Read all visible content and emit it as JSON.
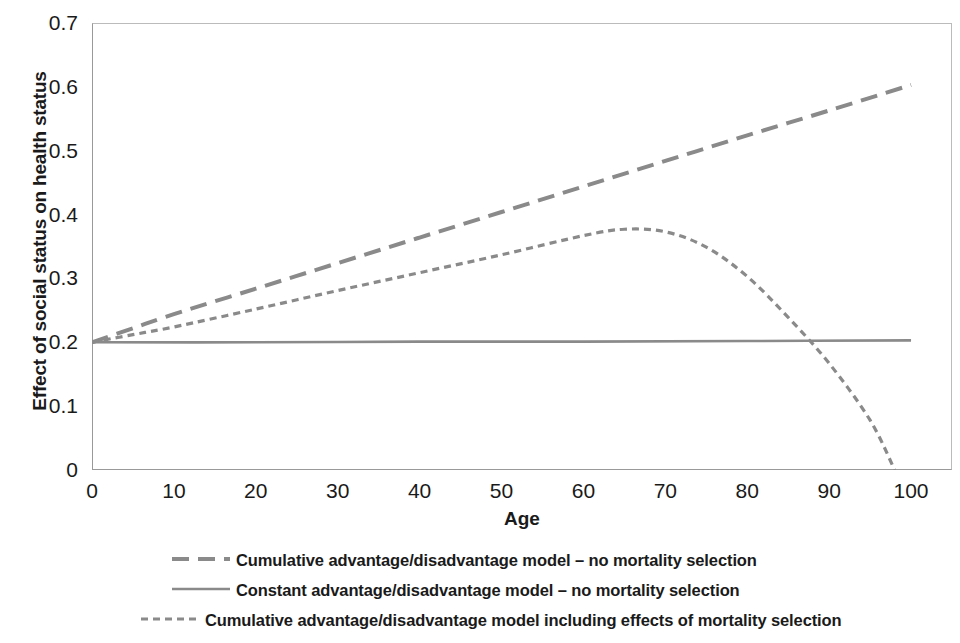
{
  "chart_data": {
    "type": "line",
    "title": "",
    "xlabel": "Age",
    "ylabel": "Effect of social status on health status",
    "xlim": [
      0,
      105
    ],
    "ylim": [
      0,
      0.7
    ],
    "xticks": [
      "0",
      "10",
      "20",
      "30",
      "40",
      "50",
      "60",
      "70",
      "80",
      "90",
      "100"
    ],
    "xtick_values": [
      0,
      10,
      20,
      30,
      40,
      50,
      60,
      70,
      80,
      90,
      100
    ],
    "yticks": [
      "0",
      "0.1",
      "0.2",
      "0.3",
      "0.4",
      "0.5",
      "0.6",
      "0.7"
    ],
    "ytick_values": [
      0,
      0.1,
      0.2,
      0.3,
      0.4,
      0.5,
      0.6,
      0.7
    ],
    "grid": false,
    "legend_position": "below",
    "line_color": "#8a8a8a",
    "axis_color": "#999999",
    "series": [
      {
        "name": "Cumulative advantage/disadvantage model – no mortality selection",
        "style": "long-dash",
        "x": [
          0,
          5,
          10,
          20,
          30,
          40,
          50,
          60,
          70,
          80,
          90,
          100
        ],
        "values": [
          0.2,
          0.222,
          0.244,
          0.284,
          0.324,
          0.364,
          0.404,
          0.444,
          0.484,
          0.524,
          0.563,
          0.603
        ]
      },
      {
        "name": "Constant advantage/disadvantage model – no mortality selection",
        "style": "solid",
        "x": [
          0,
          20,
          40,
          60,
          80,
          100
        ],
        "values": [
          0.2,
          0.2,
          0.201,
          0.201,
          0.202,
          0.203
        ]
      },
      {
        "name": "Cumulative advantage/disadvantage model including effects of mortality selection",
        "style": "short-dash",
        "x": [
          0,
          5,
          10,
          20,
          30,
          40,
          50,
          60,
          65,
          70,
          75,
          80,
          85,
          90,
          95,
          98
        ],
        "values": [
          0.2,
          0.212,
          0.224,
          0.252,
          0.281,
          0.309,
          0.337,
          0.367,
          0.377,
          0.373,
          0.349,
          0.303,
          0.239,
          0.167,
          0.078,
          0.0
        ]
      }
    ],
    "annotations": {
      "peak_age": 66,
      "peak_value": 0.377,
      "crossing_age": 85,
      "zero_crossing_age": 98
    }
  },
  "legend": {
    "entries": [
      {
        "label": "Cumulative advantage/disadvantage model – no mortality selection",
        "style": "long-dash"
      },
      {
        "label": "Constant advantage/disadvantage model – no mortality selection",
        "style": "solid"
      },
      {
        "label": "Cumulative advantage/disadvantage model including effects of mortality selection",
        "style": "short-dash"
      }
    ]
  }
}
